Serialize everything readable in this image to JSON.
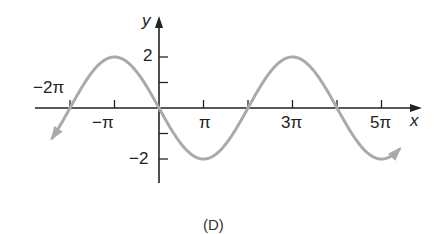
{
  "chart_data": {
    "type": "line",
    "title": "",
    "caption": "(D)",
    "function": "y = -2 sin(x/2)",
    "xlabel": "x",
    "ylabel": "y",
    "x_ticks": [
      {
        "value_pi": -2,
        "label": "−2π",
        "label_above": true
      },
      {
        "value_pi": -1,
        "label": "−π"
      },
      {
        "value_pi": 1,
        "label": "π"
      },
      {
        "value_pi": 2,
        "label": ""
      },
      {
        "value_pi": 3,
        "label": "3π"
      },
      {
        "value_pi": 4,
        "label": ""
      },
      {
        "value_pi": 5,
        "label": "5π"
      }
    ],
    "y_ticks": [
      {
        "value": 2,
        "label": "2"
      },
      {
        "value": 1,
        "label": ""
      },
      {
        "value": -1,
        "label": ""
      },
      {
        "value": -2,
        "label": "−2"
      }
    ],
    "xlim_pi": [
      -2.8,
      5.9
    ],
    "ylim": [
      -2.9,
      3.6
    ],
    "series": [
      {
        "name": "curve",
        "color": "#aaaaaa",
        "x_pi": [
          -2.4,
          -2,
          -1.5,
          -1,
          -0.5,
          0,
          0.5,
          1,
          1.5,
          2,
          2.5,
          3,
          3.5,
          4,
          4.5,
          5,
          5.4
        ],
        "y": [
          -0.62,
          0,
          1.41,
          2,
          1.41,
          0,
          -1.41,
          -2,
          -1.41,
          0,
          1.41,
          2,
          1.41,
          0,
          -1.41,
          -2,
          -1.9
        ],
        "arrows_at_ends": true
      }
    ],
    "grid": false,
    "legend": null
  },
  "labels": {
    "x_axis": "x",
    "y_axis": "y",
    "y_tick_2": "2",
    "y_tick_neg2": "−2",
    "x_tick_neg2pi": "−2π",
    "x_tick_negpi": "−π",
    "x_tick_pi": "π",
    "x_tick_3pi": "3π",
    "x_tick_5pi": "5π",
    "caption": "(D)"
  },
  "colors": {
    "axis": "#222222",
    "curve": "#aaaaaa"
  }
}
